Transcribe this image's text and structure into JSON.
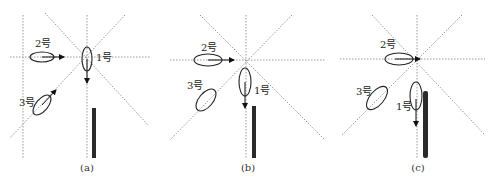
{
  "figure": {
    "panels": [
      {
        "id": "a",
        "caption": "(a)",
        "labels": {
          "ship1": "1号",
          "ship2": "2号",
          "ship3": "3号"
        }
      },
      {
        "id": "b",
        "caption": "(b)",
        "labels": {
          "ship1": "1号",
          "ship2": "2号",
          "ship3": "3号"
        }
      },
      {
        "id": "c",
        "caption": "(c)",
        "labels": {
          "ship1": "1号",
          "ship2": "2号",
          "ship3": "3号"
        }
      }
    ],
    "colors": {
      "line": "#222222",
      "guide": "#9a9a9a",
      "bar": "#2a2a2a"
    }
  }
}
